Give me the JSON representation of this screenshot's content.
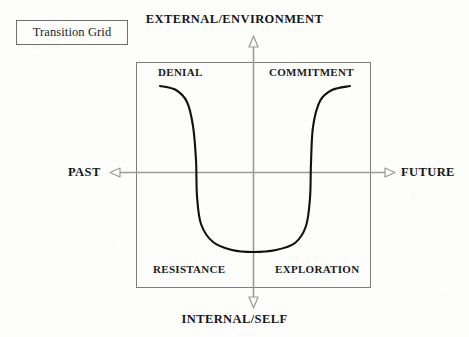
{
  "title_box": {
    "label": "Transition Grid"
  },
  "axes": {
    "top": {
      "label": "EXTERNAL/ENVIRONMENT",
      "arrow": "arrow-up-hollow"
    },
    "bottom": {
      "label": "INTERNAL/SELF",
      "arrow": "arrow-down-hollow"
    },
    "left": {
      "label": "PAST",
      "arrow": "arrow-left-hollow"
    },
    "right": {
      "label": "FUTURE",
      "arrow": "arrow-right-hollow"
    }
  },
  "quadrants": [
    {
      "key": "denial",
      "label": "DENIAL"
    },
    {
      "key": "commitment",
      "label": "COMMITMENT"
    },
    {
      "key": "resistance",
      "label": "RESISTANCE"
    },
    {
      "key": "exploration",
      "label": "EXPLORATION"
    }
  ],
  "colors": {
    "paper": "#fdfdfb",
    "curve": "#111111",
    "axis": "#9a9a9a",
    "frame": "#7d7d7d",
    "text": "#1a1a1a"
  },
  "chart_data": {
    "type": "line",
    "title": "Transition Grid",
    "xlabel": "PAST ↔ FUTURE",
    "ylabel": "INTERNAL/SELF ↔ EXTERNAL/ENVIRONMENT",
    "xlim": [
      136,
      371
    ],
    "ylim": [
      287,
      62
    ],
    "grid": false,
    "legend": "none",
    "annotations": [
      {
        "text": "DENIAL",
        "x": 182,
        "y": 73
      },
      {
        "text": "COMMITMENT",
        "x": 310,
        "y": 73
      },
      {
        "text": "RESISTANCE",
        "x": 192,
        "y": 270
      },
      {
        "text": "EXPLORATION",
        "x": 315,
        "y": 270
      }
    ],
    "series": [
      {
        "name": "transition-curve",
        "points": [
          [
            160,
            86
          ],
          [
            176,
            90
          ],
          [
            187,
            102
          ],
          [
            193,
            126
          ],
          [
            196,
            160
          ],
          [
            197,
            196
          ],
          [
            201,
            224
          ],
          [
            213,
            242
          ],
          [
            232,
            250
          ],
          [
            253,
            252
          ],
          [
            276,
            250
          ],
          [
            295,
            243
          ],
          [
            306,
            226
          ],
          [
            310,
            198
          ],
          [
            311,
            163
          ],
          [
            313,
            127
          ],
          [
            320,
            101
          ],
          [
            332,
            90
          ],
          [
            350,
            86
          ]
        ]
      }
    ]
  }
}
